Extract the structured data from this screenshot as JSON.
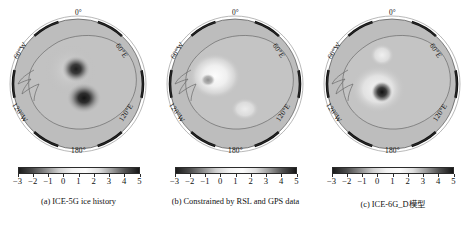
{
  "figure": {
    "projection": "polar-stereographic-south",
    "region": "Antarctica"
  },
  "lon_labels": {
    "l0": "0°",
    "l60e": "60°E",
    "l120e": "120°E",
    "l180": "180°",
    "l120w": "120°W",
    "l60w": "60°W"
  },
  "colorbar": {
    "ticks": [
      "−3",
      "−2",
      "−1",
      "0",
      "1",
      "2",
      "3",
      "4",
      "5"
    ],
    "vmin": -3,
    "vmax": 5,
    "colormap": "grayscale-diverging",
    "stops": [
      "#1c1c1c",
      "#4a4a4a",
      "#8a8a8a",
      "#cfcfcf",
      "#f2f2f2",
      "#fbfbfb",
      "#dedede",
      "#9a9a9a",
      "#4f4f4f",
      "#161616"
    ]
  },
  "panels": [
    {
      "id": "a",
      "caption": "(a) ICE-5G ice history",
      "blobs": [
        {
          "cx": 0.49,
          "cy": 0.4,
          "r": 0.115,
          "value": -3.0
        },
        {
          "cx": 0.54,
          "cy": 0.58,
          "r": 0.135,
          "value": -3.0
        }
      ]
    },
    {
      "id": "b",
      "caption": "(b) Constrained by RSL and GPS data",
      "blobs": [
        {
          "cx": 0.36,
          "cy": 0.44,
          "r": 0.16,
          "value": 4.0
        },
        {
          "cx": 0.32,
          "cy": 0.47,
          "r": 0.05,
          "value": -0.5
        },
        {
          "cx": 0.56,
          "cy": 0.66,
          "r": 0.09,
          "value": 2.5
        }
      ]
    },
    {
      "id": "c",
      "caption": "(c) ICE-6G_D模型",
      "blobs": [
        {
          "cx": 0.44,
          "cy": 0.54,
          "r": 0.075,
          "value": -3.0
        },
        {
          "cx": 0.44,
          "cy": 0.54,
          "r": 0.17,
          "value": 3.5
        },
        {
          "cx": 0.43,
          "cy": 0.27,
          "r": 0.08,
          "value": 3.0
        }
      ]
    }
  ],
  "chart_data": {
    "type": "heatmap",
    "title": "",
    "subtitle": "",
    "xlabel": "",
    "ylabel": "",
    "grid": true,
    "legend_position": "below-each-panel",
    "projection": "South polar stereographic, Antarctica",
    "colorbar": {
      "label": "",
      "tick_labels": [
        "−3",
        "−2",
        "−1",
        "0",
        "1",
        "2",
        "3",
        "4",
        "5"
      ],
      "tick_values": [
        -3,
        -2,
        -1,
        0,
        1,
        2,
        3,
        4,
        5
      ],
      "range": [
        -3,
        5
      ],
      "colormap": "grayscale, dark at both ends, light near +1"
    },
    "longitude_ticks": [
      "0°",
      "60°E",
      "120°E",
      "180°",
      "120°W",
      "60°W"
    ],
    "panels": [
      {
        "label": "(a)",
        "title": "(a) ICE-5G ice history",
        "features": [
          {
            "name": "West Antarctic anomaly",
            "approx_value": -3.0,
            "polarity": "negative"
          },
          {
            "name": "Ross-sector anomaly",
            "approx_value": -3.0,
            "polarity": "negative"
          },
          {
            "name": "Background field",
            "approx_value": 0.5,
            "polarity": "neutral"
          }
        ]
      },
      {
        "label": "(b)",
        "title": "(b) Constrained by RSL and GPS data",
        "features": [
          {
            "name": "Antarctic Peninsula / Amundsen uplift",
            "approx_value": 4.0,
            "polarity": "positive"
          },
          {
            "name": "Small negative core",
            "approx_value": -0.5,
            "polarity": "negative"
          },
          {
            "name": "East Antarctic interior patch",
            "approx_value": 2.5,
            "polarity": "positive"
          },
          {
            "name": "Background field",
            "approx_value": 0.5,
            "polarity": "neutral"
          }
        ]
      },
      {
        "label": "(c)",
        "title": "(c) ICE-6G_D模型",
        "features": [
          {
            "name": "Compact negative core",
            "approx_value": -3.0,
            "polarity": "negative"
          },
          {
            "name": "Surrounding positive halo",
            "approx_value": 3.5,
            "polarity": "positive"
          },
          {
            "name": "Northern positive patch",
            "approx_value": 3.0,
            "polarity": "positive"
          },
          {
            "name": "Background field",
            "approx_value": 0.5,
            "polarity": "neutral"
          }
        ]
      }
    ]
  }
}
